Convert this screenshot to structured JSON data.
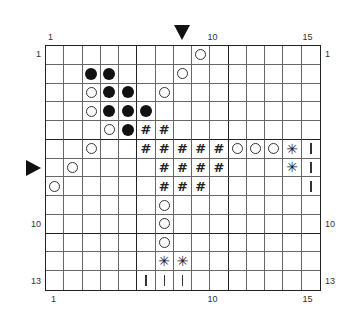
{
  "chart_data": {
    "type": "table",
    "title": "",
    "cols": 15,
    "rows": 13,
    "thick_lines": {
      "vertical_after_cols": [
        5,
        10
      ],
      "horizontal_after_rows": [
        5,
        10
      ]
    },
    "symbols_legend": {
      "open": "open circle",
      "filled": "filled circle",
      "hash": "#",
      "star": "asterisk",
      "bar": "vertical bar"
    },
    "cells": [
      {
        "row": 1,
        "col": 9,
        "sym": "open"
      },
      {
        "row": 2,
        "col": 3,
        "sym": "filled"
      },
      {
        "row": 2,
        "col": 4,
        "sym": "filled"
      },
      {
        "row": 2,
        "col": 8,
        "sym": "open"
      },
      {
        "row": 3,
        "col": 3,
        "sym": "open"
      },
      {
        "row": 3,
        "col": 4,
        "sym": "filled"
      },
      {
        "row": 3,
        "col": 5,
        "sym": "filled"
      },
      {
        "row": 3,
        "col": 7,
        "sym": "open"
      },
      {
        "row": 4,
        "col": 3,
        "sym": "open"
      },
      {
        "row": 4,
        "col": 4,
        "sym": "filled"
      },
      {
        "row": 4,
        "col": 5,
        "sym": "filled"
      },
      {
        "row": 4,
        "col": 6,
        "sym": "filled"
      },
      {
        "row": 5,
        "col": 4,
        "sym": "open"
      },
      {
        "row": 5,
        "col": 5,
        "sym": "filled"
      },
      {
        "row": 5,
        "col": 6,
        "sym": "hash"
      },
      {
        "row": 5,
        "col": 7,
        "sym": "hash"
      },
      {
        "row": 6,
        "col": 3,
        "sym": "open"
      },
      {
        "row": 6,
        "col": 6,
        "sym": "hash"
      },
      {
        "row": 6,
        "col": 7,
        "sym": "hash"
      },
      {
        "row": 6,
        "col": 8,
        "sym": "hash"
      },
      {
        "row": 6,
        "col": 9,
        "sym": "hash"
      },
      {
        "row": 6,
        "col": 10,
        "sym": "hash"
      },
      {
        "row": 6,
        "col": 11,
        "sym": "open"
      },
      {
        "row": 6,
        "col": 12,
        "sym": "open"
      },
      {
        "row": 6,
        "col": 13,
        "sym": "open"
      },
      {
        "row": 6,
        "col": 14,
        "sym": "star"
      },
      {
        "row": 6,
        "col": 15,
        "sym": "bar"
      },
      {
        "row": 7,
        "col": 2,
        "sym": "open"
      },
      {
        "row": 7,
        "col": 7,
        "sym": "hash"
      },
      {
        "row": 7,
        "col": 8,
        "sym": "hash"
      },
      {
        "row": 7,
        "col": 9,
        "sym": "hash"
      },
      {
        "row": 7,
        "col": 10,
        "sym": "hash"
      },
      {
        "row": 7,
        "col": 14,
        "sym": "star"
      },
      {
        "row": 7,
        "col": 15,
        "sym": "bar"
      },
      {
        "row": 8,
        "col": 1,
        "sym": "open"
      },
      {
        "row": 8,
        "col": 7,
        "sym": "hash"
      },
      {
        "row": 8,
        "col": 8,
        "sym": "hash"
      },
      {
        "row": 8,
        "col": 9,
        "sym": "hash"
      },
      {
        "row": 8,
        "col": 15,
        "sym": "bar"
      },
      {
        "row": 9,
        "col": 7,
        "sym": "open"
      },
      {
        "row": 10,
        "col": 7,
        "sym": "open"
      },
      {
        "row": 11,
        "col": 7,
        "sym": "open"
      },
      {
        "row": 12,
        "col": 7,
        "sym": "star"
      },
      {
        "row": 12,
        "col": 8,
        "sym": "star"
      },
      {
        "row": 13,
        "col": 6,
        "sym": "bar"
      },
      {
        "row": 13,
        "col": 7,
        "sym": "bar"
      },
      {
        "row": 13,
        "col": 8,
        "sym": "bar"
      }
    ],
    "markers": {
      "column_arrow": 8,
      "row_arrow": 7
    }
  },
  "labels": {
    "top": [
      {
        "text": "1",
        "col": 1
      },
      {
        "text": "10",
        "col": 10
      },
      {
        "text": "15",
        "col": 15
      }
    ],
    "bottom": [
      {
        "text": "1",
        "col": 1
      },
      {
        "text": "10",
        "col": 10
      },
      {
        "text": "15",
        "col": 15
      }
    ],
    "left": [
      {
        "text": "1",
        "row": 1
      },
      {
        "text": "10",
        "row": 10
      },
      {
        "text": "13",
        "row": 13
      }
    ],
    "right": [
      {
        "text": "1",
        "row": 1
      },
      {
        "text": "10",
        "row": 10
      },
      {
        "text": "13",
        "row": 13
      }
    ]
  },
  "glyphs": {
    "hash": "#",
    "star": "✳"
  }
}
